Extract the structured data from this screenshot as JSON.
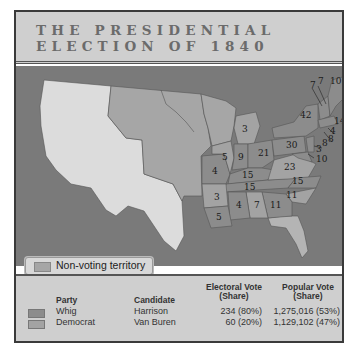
{
  "title": {
    "line1": "THE PRESIDENTIAL",
    "line2": "ELECTION OF 1840"
  },
  "map": {
    "non_voting_label": "Non-voting territory",
    "electoral_labels": [
      {
        "state": "Maine",
        "value": "10"
      },
      {
        "state": "New Hampshire",
        "value": "7"
      },
      {
        "state": "Vermont",
        "value": "7"
      },
      {
        "state": "Massachusetts",
        "value": "14"
      },
      {
        "state": "Rhode Island",
        "value": "4"
      },
      {
        "state": "Connecticut",
        "value": "8"
      },
      {
        "state": "New York",
        "value": "42"
      },
      {
        "state": "New Jersey",
        "value": "8"
      },
      {
        "state": "Delaware",
        "value": "3"
      },
      {
        "state": "Maryland",
        "value": "10"
      },
      {
        "state": "Pennsylvania",
        "value": "30"
      },
      {
        "state": "Michigan",
        "value": "3"
      },
      {
        "state": "Ohio",
        "value": "21"
      },
      {
        "state": "Indiana",
        "value": "9"
      },
      {
        "state": "Illinois",
        "value": "5"
      },
      {
        "state": "Missouri",
        "value": "4"
      },
      {
        "state": "Kentucky",
        "value": "15"
      },
      {
        "state": "Virginia",
        "value": "23"
      },
      {
        "state": "Tennessee",
        "value": "15"
      },
      {
        "state": "North Carolina",
        "value": "15"
      },
      {
        "state": "South Carolina",
        "value": "11"
      },
      {
        "state": "Georgia",
        "value": "11"
      },
      {
        "state": "Alabama",
        "value": "7"
      },
      {
        "state": "Mississippi",
        "value": "4"
      },
      {
        "state": "Arkansas",
        "value": "3"
      },
      {
        "state": "Louisiana",
        "value": "5"
      }
    ]
  },
  "legend": {
    "headers": {
      "party": "Party",
      "candidate": "Candidate",
      "electoral": "Electoral Vote",
      "electoral_sub": "(Share)",
      "popular": "Popular Vote",
      "popular_sub": "(Share)"
    },
    "rows": [
      {
        "party": "Whig",
        "candidate": "Harrison",
        "electoral": "234 (80%)",
        "popular": "1,275,016 (53%)",
        "color": "#8c8c8c"
      },
      {
        "party": "Democrat",
        "candidate": "Van Buren",
        "electoral": "60 (20%)",
        "popular": "1,129,102 (47%)",
        "color": "#a3a3a3"
      }
    ]
  },
  "colors": {
    "water": "#7a7a7a",
    "non_voting": "#a6a6a6",
    "foreign_land": "#dcdcdc",
    "whig": "#8c8c8c",
    "democrat": "#a3a3a3",
    "panel": "#cfcfcf"
  }
}
